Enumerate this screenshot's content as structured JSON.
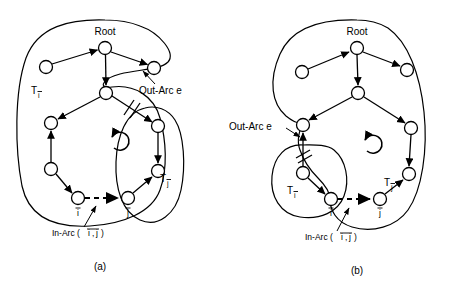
{
  "figure": {
    "background": "#ffffff",
    "ink_color": "#000000",
    "panels": [
      {
        "id": "a",
        "caption": "(a)",
        "labels": {
          "root": "Root",
          "subtree_left": "T",
          "subtree_left_sub": "ī",
          "subtree_right": "T",
          "subtree_right_sub": "j̄",
          "out_arc": "Out-Arc e",
          "in_arc": "In-Arc ( ī, j̄ )",
          "in_arc_prefix": "In-Arc (",
          "in_arc_i": "i",
          "in_arc_comma": ",",
          "in_arc_j": "j",
          "in_arc_suffix": ")",
          "node_i": "ī",
          "node_j": "j̄"
        },
        "nodes": [
          {
            "name": "root",
            "x": 105,
            "y": 48,
            "r": 6.5,
            "label": "Root"
          },
          {
            "name": "left-child",
            "x": 46,
            "y": 67,
            "r": 6.5,
            "label": ""
          },
          {
            "name": "right-child",
            "x": 154,
            "y": 68,
            "r": 6.5,
            "label": ""
          },
          {
            "name": "junction",
            "x": 106,
            "y": 93,
            "r": 6.5,
            "label": ""
          },
          {
            "name": "left-a",
            "x": 51,
            "y": 123,
            "r": 6.5,
            "label": ""
          },
          {
            "name": "left-b",
            "x": 51,
            "y": 169,
            "r": 6.5,
            "label": ""
          },
          {
            "name": "node-i",
            "x": 78,
            "y": 198,
            "r": 6.5,
            "label": "ī"
          },
          {
            "name": "node-j",
            "x": 128,
            "y": 198,
            "r": 6.5,
            "label": "j̄"
          },
          {
            "name": "right-a",
            "x": 158,
            "y": 126,
            "r": 6.5,
            "label": ""
          },
          {
            "name": "right-b",
            "x": 158,
            "y": 171,
            "r": 6.5,
            "label": ""
          }
        ],
        "edges": [
          {
            "from": "left-child",
            "to": "root",
            "type": "arrow"
          },
          {
            "from": "root",
            "to": "right-child",
            "type": "arrow"
          },
          {
            "from": "root",
            "to": "junction",
            "type": "arrow"
          },
          {
            "from": "junction",
            "to": "left-a",
            "type": "arrow"
          },
          {
            "from": "left-b",
            "to": "left-a",
            "type": "arrow"
          },
          {
            "from": "left-b",
            "to": "node-i",
            "type": "arrow"
          },
          {
            "from": "junction",
            "to": "right-a",
            "type": "arrow",
            "cut": true
          },
          {
            "from": "right-a",
            "to": "right-b",
            "type": "arrow"
          },
          {
            "from": "node-j",
            "to": "right-b",
            "type": "arrow"
          },
          {
            "from": "node-i",
            "to": "node-j",
            "type": "dashed-arrow"
          }
        ],
        "cycle_arrow": {
          "cx": 108,
          "cy": 144,
          "r": 9,
          "direction": "clockwise"
        }
      },
      {
        "id": "b",
        "caption": "(b)",
        "labels": {
          "root": "Root",
          "subtree_left": "T",
          "subtree_left_sub": "ī",
          "subtree_right": "T",
          "subtree_right_sub": "j̄",
          "out_arc": "Out-Arc e",
          "in_arc": "In-Arc ( ī, j̄ )",
          "in_arc_prefix": "In-Arc (",
          "in_arc_i": "i",
          "in_arc_comma": ",",
          "in_arc_j": "j",
          "in_arc_suffix": ")",
          "node_i": "ī",
          "node_j": "j̄"
        },
        "nodes": [
          {
            "name": "root",
            "x": 357,
            "y": 48,
            "r": 6.5,
            "label": "Root"
          },
          {
            "name": "left-child",
            "x": 302,
            "y": 72,
            "r": 6.5,
            "label": ""
          },
          {
            "name": "right-child",
            "x": 407,
            "y": 70,
            "r": 6.5,
            "label": ""
          },
          {
            "name": "junction",
            "x": 358,
            "y": 93,
            "r": 6.5,
            "label": ""
          },
          {
            "name": "left-a",
            "x": 303,
            "y": 125,
            "r": 6.5,
            "label": ""
          },
          {
            "name": "left-b",
            "x": 303,
            "y": 173,
            "r": 6.5,
            "label": ""
          },
          {
            "name": "node-i",
            "x": 331,
            "y": 199,
            "r": 6.5,
            "label": "ī"
          },
          {
            "name": "node-j",
            "x": 380,
            "y": 199,
            "r": 6.5,
            "label": "j̄"
          },
          {
            "name": "right-a",
            "x": 411,
            "y": 128,
            "r": 6.5,
            "label": ""
          },
          {
            "name": "right-b",
            "x": 409,
            "y": 174,
            "r": 6.5,
            "label": ""
          }
        ],
        "edges": [
          {
            "from": "left-child",
            "to": "root",
            "type": "arrow"
          },
          {
            "from": "root",
            "to": "right-child",
            "type": "arrow"
          },
          {
            "from": "root",
            "to": "junction",
            "type": "arrow"
          },
          {
            "from": "junction",
            "to": "left-a",
            "type": "arrow"
          },
          {
            "from": "junction",
            "to": "right-a",
            "type": "arrow"
          },
          {
            "from": "left-b",
            "to": "left-a",
            "type": "arrow",
            "cut": true
          },
          {
            "from": "left-b",
            "to": "node-i",
            "type": "arrow"
          },
          {
            "from": "right-a",
            "to": "right-b",
            "type": "arrow"
          },
          {
            "from": "node-j",
            "to": "right-b",
            "type": "arrow"
          },
          {
            "from": "node-i",
            "to": "node-j",
            "type": "dashed-arrow"
          }
        ],
        "cycle_arrow": {
          "cx": 361,
          "cy": 147,
          "r": 9,
          "direction": "clockwise"
        }
      }
    ]
  }
}
